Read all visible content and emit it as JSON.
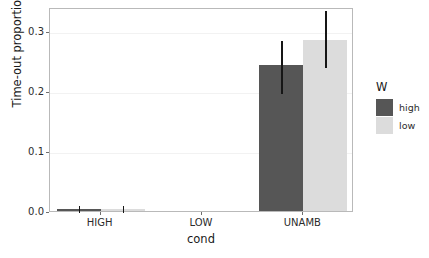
{
  "chart_data": {
    "type": "bar",
    "title": "",
    "xlabel": "cond",
    "ylabel": "Time-out proportion",
    "categories": [
      "HIGH",
      "LOW",
      "UNAMB"
    ],
    "series": [
      {
        "name": "high",
        "color": "#565656",
        "values": [
          0.004,
          0.0,
          0.243
        ],
        "errors_low": [
          0.0,
          0.0,
          0.198
        ],
        "errors_high": [
          0.011,
          0.0,
          0.287
        ]
      },
      {
        "name": "low",
        "color": "#dcdcdc",
        "values": [
          0.004,
          0.0,
          0.285
        ],
        "errors_low": [
          0.0,
          0.0,
          0.242
        ],
        "errors_high": [
          0.011,
          0.0,
          0.337
        ]
      }
    ],
    "ylim": [
      0.0,
      0.34
    ],
    "yticks": [
      0.0,
      0.1,
      0.2,
      0.3
    ],
    "ytick_labels": [
      "0.0",
      "0.1",
      "0.2",
      "0.3"
    ],
    "grid": "horizontal-major-only",
    "legend_position": "right",
    "legend_title": "W",
    "legend_entries": [
      "high",
      "low"
    ]
  },
  "axes": {
    "y_title": "Time-out proportion",
    "x_title": "cond",
    "y_tick_labels": [
      "0.0",
      "0.1",
      "0.2",
      "0.3"
    ],
    "x_tick_labels": [
      "HIGH",
      "LOW",
      "UNAMB"
    ]
  },
  "legend": {
    "title": "W",
    "items": [
      {
        "label": "high",
        "color": "#565656"
      },
      {
        "label": "low",
        "color": "#dcdcdc"
      }
    ]
  },
  "title_strip": {
    "text": ""
  },
  "colors": {
    "panel_border": "#b9b9b9",
    "gridline": "#f2f2f2",
    "error_bar": "#161616",
    "text": "#2b2b2b",
    "background": "#ffffff"
  }
}
